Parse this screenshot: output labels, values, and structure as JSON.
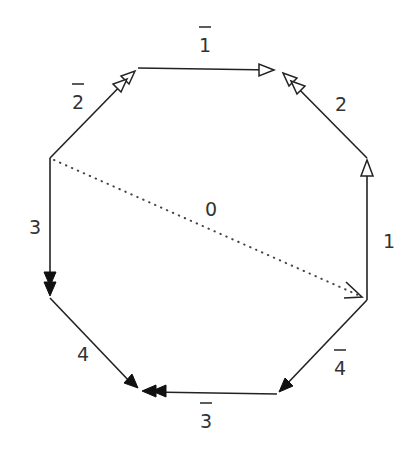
{
  "diagram": {
    "type": "octagon-edge-labeling",
    "colors": {
      "stroke": "#222222",
      "label": "#333333",
      "background": "#ffffff"
    },
    "vertices": {
      "A": [
        138,
        68
      ],
      "B": [
        280,
        70
      ],
      "C": [
        367,
        158
      ],
      "D": [
        367,
        300
      ],
      "E": [
        277,
        394
      ],
      "F": [
        140,
        390
      ],
      "G": [
        50,
        298
      ],
      "H": [
        50,
        158
      ]
    },
    "edges": [
      {
        "id": "e1bar",
        "from": "A",
        "to": "B",
        "label": "1",
        "overline": true,
        "arrow": "open",
        "count": 1
      },
      {
        "id": "e2",
        "from": "C",
        "to": "B",
        "label": "2",
        "overline": false,
        "arrow": "open",
        "count": 2
      },
      {
        "id": "e1",
        "from": "D",
        "to": "C",
        "label": "1",
        "overline": false,
        "arrow": "open",
        "count": 1
      },
      {
        "id": "e4bar",
        "from": "D",
        "to": "E",
        "label": "4",
        "overline": true,
        "arrow": "filled",
        "count": 1
      },
      {
        "id": "e3bar",
        "from": "E",
        "to": "F",
        "label": "3",
        "overline": true,
        "arrow": "filled",
        "count": 2
      },
      {
        "id": "e4",
        "from": "G",
        "to": "F",
        "label": "4",
        "overline": false,
        "arrow": "filled",
        "count": 1
      },
      {
        "id": "e3",
        "from": "H",
        "to": "G",
        "label": "3",
        "overline": false,
        "arrow": "filled",
        "count": 2
      },
      {
        "id": "e2bar",
        "from": "H",
        "to": "A",
        "label": "2",
        "overline": true,
        "arrow": "open",
        "count": 2
      },
      {
        "id": "e0",
        "from": "H",
        "to": "D",
        "label": "0",
        "overline": false,
        "arrow": "line",
        "count": 1,
        "style": "dotted"
      }
    ],
    "labels": {
      "e1bar": "1",
      "e2": "2",
      "e1": "1",
      "e4bar": "4",
      "e3bar": "3",
      "e4": "4",
      "e3": "3",
      "e2bar": "2",
      "e0": "0"
    }
  }
}
